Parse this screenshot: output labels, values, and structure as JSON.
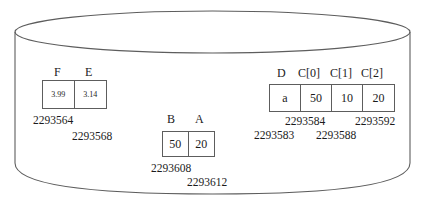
{
  "diagram": {
    "container": {
      "name": "memory-cylinder",
      "shape": "cylinder",
      "stroke_color": "#5d5d5d",
      "fill_color": "#ffffff"
    },
    "groups": [
      {
        "id": "fe",
        "headers": [
          "F",
          "E"
        ],
        "cells": [
          "3.99",
          "3.14"
        ],
        "cell_font": "small",
        "addresses": [
          "2293564",
          "2293568"
        ]
      },
      {
        "id": "ba",
        "headers": [
          "B",
          "A"
        ],
        "cells": [
          "50",
          "20"
        ],
        "cell_font": "normal",
        "addresses": [
          "2293608",
          "2293612"
        ]
      },
      {
        "id": "dc",
        "headers": [
          "D",
          "C[0]",
          "C[1]",
          "C[2]"
        ],
        "cells": [
          "a",
          "50",
          "10",
          "20"
        ],
        "cell_font": "normal",
        "addresses": [
          "2293584",
          "2293592",
          "2293583",
          "2293588"
        ]
      }
    ]
  }
}
